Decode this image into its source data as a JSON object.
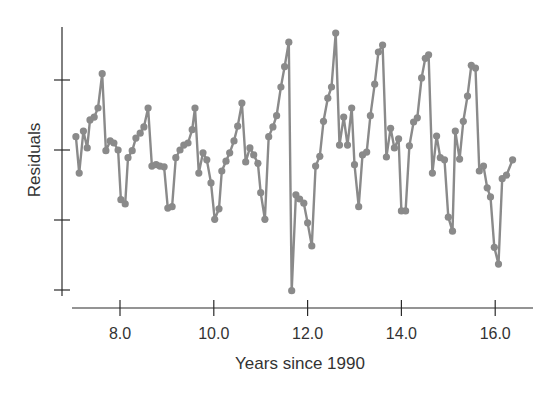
{
  "chart_data": {
    "type": "line",
    "title": "",
    "xlabel": "Years since 1990",
    "ylabel": "Residuals",
    "xlim": [
      6.85,
      16.95
    ],
    "ylim": [
      -2.2,
      1.77
    ],
    "x_ticks": [
      8.0,
      10.0,
      12.0,
      14.0,
      16.0
    ],
    "x_tick_labels": [
      "8.0",
      "10.0",
      "12.0",
      "14.0",
      "16.0"
    ],
    "y_ticks": [
      -2,
      -1,
      0,
      1
    ],
    "y_tick_labels": [
      "",
      "",
      "",
      ""
    ],
    "grid": false,
    "legend": null,
    "markers": true,
    "series_color": "#8a8a8a",
    "axis_color": "#2a2a2a",
    "series": [
      {
        "name": "Residuals",
        "x": [
          7.06,
          7.13,
          7.22,
          7.3,
          7.36,
          7.45,
          7.53,
          7.62,
          7.7,
          7.79,
          7.87,
          7.96,
          8.02,
          8.11,
          8.17,
          8.26,
          8.34,
          8.43,
          8.51,
          8.6,
          8.68,
          8.77,
          8.85,
          8.94,
          9.02,
          9.11,
          9.19,
          9.28,
          9.36,
          9.45,
          9.54,
          9.6,
          9.68,
          9.77,
          9.85,
          9.94,
          10.02,
          10.11,
          10.17,
          10.26,
          10.34,
          10.43,
          10.51,
          10.6,
          10.68,
          10.77,
          10.85,
          10.94,
          11.0,
          11.09,
          11.17,
          11.26,
          11.34,
          11.43,
          11.51,
          11.6,
          11.66,
          11.75,
          11.83,
          11.92,
          12.0,
          12.09,
          12.17,
          12.26,
          12.34,
          12.43,
          12.51,
          12.6,
          12.68,
          12.77,
          12.85,
          12.94,
          13.0,
          13.09,
          13.17,
          13.26,
          13.34,
          13.43,
          13.51,
          13.6,
          13.68,
          13.77,
          13.85,
          13.94,
          14.0,
          14.09,
          14.17,
          14.26,
          14.34,
          14.43,
          14.51,
          14.58,
          14.66,
          14.75,
          14.83,
          14.92,
          15.0,
          15.09,
          15.15,
          15.24,
          15.32,
          15.41,
          15.49,
          15.58,
          15.66,
          15.75,
          15.83,
          15.9,
          15.98,
          16.07,
          16.15,
          16.24,
          16.37
        ],
        "values": [
          0.19,
          -0.33,
          0.27,
          0.03,
          0.43,
          0.47,
          0.6,
          1.09,
          -0.01,
          0.13,
          0.1,
          0.0,
          -0.71,
          -0.77,
          -0.11,
          -0.01,
          0.17,
          0.24,
          0.33,
          0.6,
          -0.23,
          -0.21,
          -0.23,
          -0.24,
          -0.83,
          -0.81,
          -0.11,
          0.0,
          0.07,
          0.1,
          0.29,
          0.6,
          -0.33,
          -0.04,
          -0.14,
          -0.47,
          -0.99,
          -0.84,
          -0.3,
          -0.16,
          -0.04,
          0.13,
          0.34,
          0.67,
          -0.17,
          0.03,
          -0.07,
          -0.19,
          -0.61,
          -0.99,
          0.19,
          0.33,
          0.49,
          0.9,
          1.19,
          1.54,
          -2.01,
          -0.64,
          -0.7,
          -0.76,
          -1.04,
          -1.37,
          -0.23,
          -0.09,
          0.41,
          0.74,
          0.9,
          1.67,
          0.07,
          0.47,
          0.07,
          0.6,
          -0.21,
          -0.81,
          -0.07,
          -0.03,
          0.49,
          0.94,
          1.4,
          1.5,
          -0.1,
          0.31,
          0.03,
          0.16,
          -0.87,
          -0.87,
          0.06,
          0.4,
          0.46,
          1.03,
          1.31,
          1.36,
          -0.33,
          0.2,
          -0.11,
          -0.14,
          -0.96,
          -1.16,
          0.27,
          -0.13,
          0.41,
          0.77,
          1.21,
          1.17,
          -0.3,
          -0.23,
          -0.54,
          -0.67,
          -1.39,
          -1.63,
          -0.41,
          -0.36,
          -0.14
        ]
      }
    ]
  }
}
